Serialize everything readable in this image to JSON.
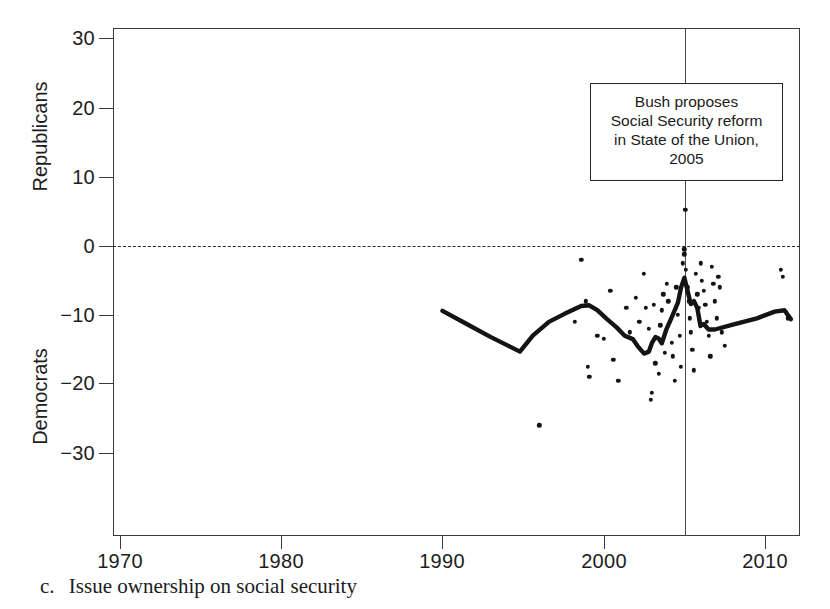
{
  "caption": {
    "letter": "c.",
    "text": "Issue ownership on social security"
  },
  "annotation": {
    "lines": [
      "Bush proposes",
      "Social Security reform",
      "in State of the Union,",
      "2005"
    ],
    "event_year": 2005
  },
  "chart_data": {
    "type": "scatter",
    "title": "",
    "subtitle": "",
    "xlabel": "",
    "ylabel": "",
    "ylabel_top": "Republicans",
    "ylabel_bottom": "Democrats",
    "xlim": [
      1966.5,
      2012.7
    ],
    "ylim": [
      -42.0,
      31.5
    ],
    "xticks": [
      1970,
      1980,
      1990,
      2000,
      2010
    ],
    "xticklabels": [
      "1970",
      "1980",
      "1990",
      "2000",
      "2010"
    ],
    "yticks": [
      30,
      20,
      10,
      0,
      -10,
      -20,
      -30
    ],
    "yticklabels": [
      "30",
      "20",
      "10",
      "0",
      "−10",
      "−20",
      "−30"
    ],
    "grid": false,
    "legend": null,
    "zero_reference_line": {
      "y": 0,
      "style": "dashed"
    },
    "vertical_reference_line": {
      "x": 2005,
      "style": "solid",
      "label": "Bush proposes Social Security reform in State of the Union, 2005"
    },
    "marker_color": "#141414",
    "line_color": "#141414",
    "points": [
      [
        1996.0,
        -26.0
      ],
      [
        1998.2,
        -11.0
      ],
      [
        1998.6,
        -2.0
      ],
      [
        1998.9,
        -8.0
      ],
      [
        1999.0,
        -17.5
      ],
      [
        1999.1,
        -19.0
      ],
      [
        1999.6,
        -13.0
      ],
      [
        1999.7,
        -9.5
      ],
      [
        2000.0,
        -13.5
      ],
      [
        2000.4,
        -6.5
      ],
      [
        2000.6,
        -16.5
      ],
      [
        2000.9,
        -19.5
      ],
      [
        2001.4,
        -9.0
      ],
      [
        2001.6,
        -12.5
      ],
      [
        2002.0,
        -7.5
      ],
      [
        2002.2,
        -11.0
      ],
      [
        2002.5,
        -4.0
      ],
      [
        2002.6,
        -9.0
      ],
      [
        2002.8,
        -12.0
      ],
      [
        2002.9,
        -22.3
      ],
      [
        2003.0,
        -21.3
      ],
      [
        2003.1,
        -8.5
      ],
      [
        2003.2,
        -17.0
      ],
      [
        2003.4,
        -18.5
      ],
      [
        2003.5,
        -11.5
      ],
      [
        2003.6,
        -9.3
      ],
      [
        2003.7,
        -7.0
      ],
      [
        2003.8,
        -15.5
      ],
      [
        2003.9,
        -5.5
      ],
      [
        2004.0,
        -8.0
      ],
      [
        2004.1,
        -11.0
      ],
      [
        2004.2,
        -14.0
      ],
      [
        2004.3,
        -16.0
      ],
      [
        2004.4,
        -19.5
      ],
      [
        2004.5,
        -6.0
      ],
      [
        2004.6,
        -10.0
      ],
      [
        2004.7,
        -13.0
      ],
      [
        2004.8,
        -17.5
      ],
      [
        2004.9,
        -2.5
      ],
      [
        2005.0,
        -0.5
      ],
      [
        2005.0,
        -1.2
      ],
      [
        2005.05,
        5.2
      ],
      [
        2005.1,
        -3.5
      ],
      [
        2005.2,
        -6.0
      ],
      [
        2005.3,
        -8.0
      ],
      [
        2005.35,
        -10.5
      ],
      [
        2005.4,
        -12.5
      ],
      [
        2005.5,
        -15.0
      ],
      [
        2005.6,
        -18.0
      ],
      [
        2005.7,
        -4.0
      ],
      [
        2005.8,
        -7.0
      ],
      [
        2005.9,
        -9.0
      ],
      [
        2006.0,
        -2.5
      ],
      [
        2006.1,
        -5.0
      ],
      [
        2006.2,
        -6.5
      ],
      [
        2006.3,
        -8.5
      ],
      [
        2006.4,
        -11.0
      ],
      [
        2006.5,
        -13.0
      ],
      [
        2006.6,
        -16.0
      ],
      [
        2006.7,
        -3.0
      ],
      [
        2006.8,
        -5.5
      ],
      [
        2006.9,
        -8.0
      ],
      [
        2007.0,
        -10.5
      ],
      [
        2007.1,
        -4.5
      ],
      [
        2007.2,
        -6.0
      ],
      [
        2007.3,
        -12.5
      ],
      [
        2007.5,
        -14.5
      ],
      [
        2011.0,
        -3.5
      ],
      [
        2011.1,
        -4.5
      ],
      [
        2011.3,
        -9.5
      ],
      [
        2011.4,
        -10.5
      ]
    ],
    "trend_line": [
      [
        1990.0,
        -9.4
      ],
      [
        1991.5,
        -11.3
      ],
      [
        1993.0,
        -13.2
      ],
      [
        1994.8,
        -15.3
      ],
      [
        1995.6,
        -13.0
      ],
      [
        1996.6,
        -11.0
      ],
      [
        1997.6,
        -9.8
      ],
      [
        1998.6,
        -8.7
      ],
      [
        1999.1,
        -8.6
      ],
      [
        1999.6,
        -9.3
      ],
      [
        2000.2,
        -10.6
      ],
      [
        2000.8,
        -11.8
      ],
      [
        2001.3,
        -13.0
      ],
      [
        2001.8,
        -13.5
      ],
      [
        2002.1,
        -14.5
      ],
      [
        2002.5,
        -15.6
      ],
      [
        2002.8,
        -15.3
      ],
      [
        2003.0,
        -14.0
      ],
      [
        2003.2,
        -13.2
      ],
      [
        2003.4,
        -13.4
      ],
      [
        2003.6,
        -14.1
      ],
      [
        2003.9,
        -12.0
      ],
      [
        2004.2,
        -10.4
      ],
      [
        2004.6,
        -8.2
      ],
      [
        2004.8,
        -6.0
      ],
      [
        2005.0,
        -4.6
      ],
      [
        2005.2,
        -6.5
      ],
      [
        2005.4,
        -8.4
      ],
      [
        2005.6,
        -8.0
      ],
      [
        2005.8,
        -9.0
      ],
      [
        2006.0,
        -11.6
      ],
      [
        2006.2,
        -11.3
      ],
      [
        2006.5,
        -12.1
      ],
      [
        2006.9,
        -12.1
      ],
      [
        2008.0,
        -11.4
      ],
      [
        2009.5,
        -10.5
      ],
      [
        2010.6,
        -9.5
      ],
      [
        2011.2,
        -9.3
      ],
      [
        2011.6,
        -10.6
      ]
    ]
  }
}
